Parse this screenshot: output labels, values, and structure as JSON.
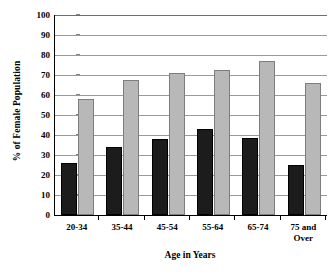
{
  "chart_data": {
    "type": "bar",
    "title": "",
    "subtitle": "",
    "xlabel": "Age in Years",
    "ylabel": "% of Female Population",
    "categories": [
      "20-34",
      "35-44",
      "45-54",
      "55-64",
      "65-74",
      "75 and Over"
    ],
    "category_lines": [
      [
        "20-34"
      ],
      [
        "35-44"
      ],
      [
        "45-54"
      ],
      [
        "55-64"
      ],
      [
        "65-74"
      ],
      [
        "75 and",
        "Over"
      ]
    ],
    "series": [
      {
        "name": "dark",
        "color": "#1c1c1c",
        "values": [
          26,
          34,
          38,
          43,
          38.5,
          25
        ]
      },
      {
        "name": "light",
        "color": "#b8b8b8",
        "values": [
          58,
          67.5,
          71,
          72.5,
          77,
          66
        ]
      }
    ],
    "ylim": [
      0,
      100
    ],
    "ytick_step": 10,
    "yticks": [
      0,
      10,
      20,
      30,
      40,
      50,
      60,
      70,
      80,
      90,
      100
    ],
    "ytick_labels": [
      "0",
      "10",
      "20",
      "30",
      "40",
      "50",
      "60",
      "70",
      "80",
      "90",
      "100"
    ],
    "grid": true,
    "grid_axis": "y",
    "legend": false,
    "legend_position": "none",
    "annotations": []
  }
}
